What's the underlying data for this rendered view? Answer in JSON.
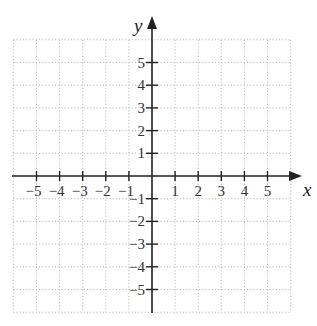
{
  "diagram": {
    "type": "cartesian-coordinate-plane",
    "x_axis": {
      "label": "x",
      "ticks": [
        -5,
        -4,
        -3,
        -2,
        -1,
        1,
        2,
        3,
        4,
        5
      ],
      "tick_labels": [
        "−5",
        "−4",
        "−3",
        "−2",
        "−1",
        "1",
        "2",
        "3",
        "4",
        "5"
      ],
      "range": [
        -6,
        6
      ]
    },
    "y_axis": {
      "label": "y",
      "ticks": [
        5,
        4,
        3,
        2,
        1,
        -1,
        -2,
        -3,
        -4,
        -5
      ],
      "tick_labels": [
        "5",
        "4",
        "3",
        "2",
        "1",
        "−1",
        "−2",
        "−3",
        "−4",
        "−5"
      ],
      "range": [
        -6,
        6
      ]
    },
    "grid": {
      "style": "dotted",
      "spacing": 1,
      "color": "#bbbbbb"
    },
    "axis_color": "#222222"
  }
}
